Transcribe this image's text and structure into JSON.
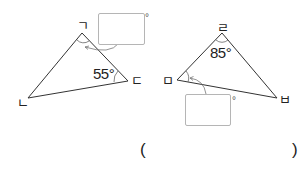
{
  "left_triangle": {
    "vertices": {
      "top": "ㄱ",
      "bottom_left": "ㄴ",
      "right": "ㄷ"
    },
    "given_angle": "55°",
    "given_angle_vertex": "ㄷ",
    "answer_box": {
      "value": "",
      "unit": "°",
      "target_vertex": "ㄱ"
    }
  },
  "right_triangle": {
    "vertices": {
      "top": "ㄹ",
      "left": "ㅁ",
      "right": "ㅂ"
    },
    "given_angle": "85°",
    "given_angle_vertex": "ㄹ",
    "answer_box": {
      "value": "",
      "unit": "°",
      "target_vertex": "ㅁ"
    }
  },
  "answer": {
    "open_paren": "(",
    "close_paren": ")",
    "value": ""
  }
}
